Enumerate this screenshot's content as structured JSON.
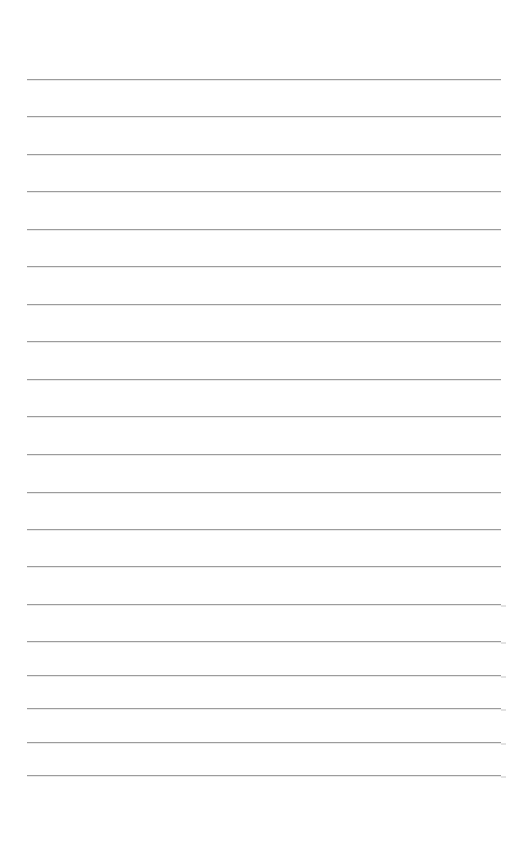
{
  "page": {
    "type": "lined-paper",
    "background": "#ffffff",
    "line_color": "#9c9c9c",
    "margin_left_px": 27,
    "line_right_px": 501,
    "line_count": 20,
    "line_y_positions": [
      79,
      116,
      154,
      191,
      229,
      266,
      304,
      341,
      379,
      416,
      454,
      492,
      529,
      566,
      604,
      641,
      675,
      708,
      742,
      775
    ]
  }
}
